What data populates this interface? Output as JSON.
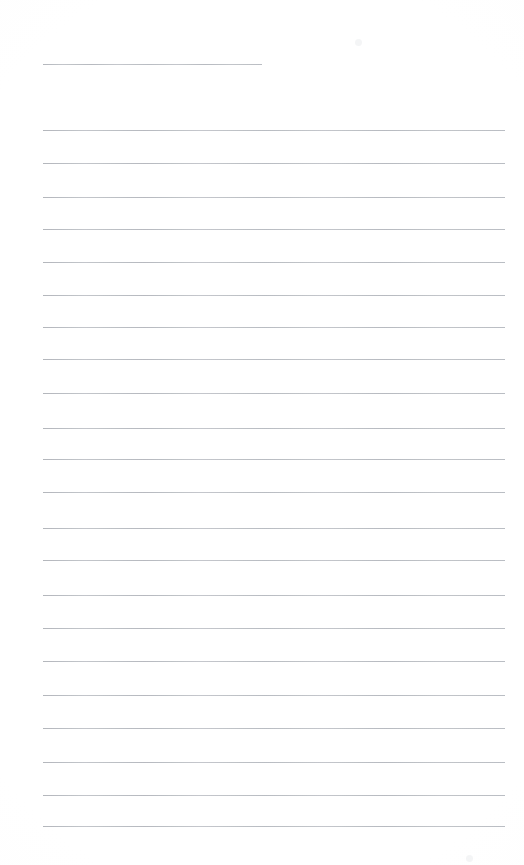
{
  "document": {
    "kind": "scanned-blank-lined-page",
    "title": "",
    "body_text": "",
    "page_width": 524,
    "page_height": 865,
    "background_color": "#fefefe",
    "rule_color": "#c9ccd1",
    "has_vertical_margin_rule": false,
    "has_handwriting": false,
    "has_printed_text": false
  },
  "layout": {
    "rule_left_x": 43,
    "rule_right_x": 505,
    "rule_thickness_px": 1,
    "rule_spacing_px": 33.2,
    "top_margin_px": 64,
    "bottom_margin_px": 39
  },
  "header_rule": {
    "name": "header-rule",
    "y": 64,
    "x_start": 43,
    "x_end": 262,
    "width": 219
  },
  "body_rules": [
    {
      "index": 1,
      "y": 130,
      "x_start": 43,
      "x_end": 505,
      "text": ""
    },
    {
      "index": 2,
      "y": 163,
      "x_start": 43,
      "x_end": 505,
      "text": ""
    },
    {
      "index": 3,
      "y": 197,
      "x_start": 43,
      "x_end": 505,
      "text": ""
    },
    {
      "index": 4,
      "y": 229,
      "x_start": 43,
      "x_end": 505,
      "text": ""
    },
    {
      "index": 5,
      "y": 262,
      "x_start": 43,
      "x_end": 505,
      "text": ""
    },
    {
      "index": 6,
      "y": 295,
      "x_start": 43,
      "x_end": 505,
      "text": ""
    },
    {
      "index": 7,
      "y": 327,
      "x_start": 43,
      "x_end": 505,
      "text": ""
    },
    {
      "index": 8,
      "y": 359,
      "x_start": 43,
      "x_end": 505,
      "text": ""
    },
    {
      "index": 9,
      "y": 393,
      "x_start": 43,
      "x_end": 505,
      "text": ""
    },
    {
      "index": 10,
      "y": 428,
      "x_start": 43,
      "x_end": 505,
      "text": ""
    },
    {
      "index": 11,
      "y": 459,
      "x_start": 43,
      "x_end": 505,
      "text": ""
    },
    {
      "index": 12,
      "y": 492,
      "x_start": 43,
      "x_end": 505,
      "text": ""
    },
    {
      "index": 13,
      "y": 528,
      "x_start": 43,
      "x_end": 505,
      "text": ""
    },
    {
      "index": 14,
      "y": 560,
      "x_start": 43,
      "x_end": 505,
      "text": ""
    },
    {
      "index": 15,
      "y": 595,
      "x_start": 43,
      "x_end": 505,
      "text": ""
    },
    {
      "index": 16,
      "y": 628,
      "x_start": 43,
      "x_end": 505,
      "text": ""
    },
    {
      "index": 17,
      "y": 661,
      "x_start": 43,
      "x_end": 505,
      "text": ""
    },
    {
      "index": 18,
      "y": 695,
      "x_start": 43,
      "x_end": 505,
      "text": ""
    },
    {
      "index": 19,
      "y": 728,
      "x_start": 43,
      "x_end": 505,
      "text": ""
    },
    {
      "index": 20,
      "y": 762,
      "x_start": 43,
      "x_end": 505,
      "text": ""
    },
    {
      "index": 21,
      "y": 795,
      "x_start": 43,
      "x_end": 505,
      "text": ""
    },
    {
      "index": 22,
      "y": 826,
      "x_start": 43,
      "x_end": 505,
      "text": ""
    }
  ],
  "artifacts": [
    {
      "name": "scan-speck-top-right",
      "x": 355,
      "y": 39,
      "intensity": "faint"
    },
    {
      "name": "scan-speck-bottom-right",
      "x": 466,
      "y": 855,
      "intensity": "faint"
    }
  ]
}
